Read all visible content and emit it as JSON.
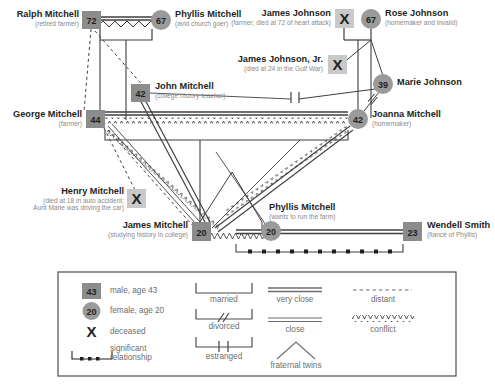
{
  "diagram": {
    "colors": {
      "male_fill": "#8c8c8c",
      "female_fill": "#9a9a9a",
      "line": "#3f3f3f",
      "label_name": "#231f20",
      "label_sub": "#8a8a8a",
      "legend_text": "#6d6d6d",
      "legend_border": "#4d4d4d"
    },
    "persons": [
      {
        "id": "ralph",
        "name": "Ralph Mitchell",
        "note": "(retired farmer)",
        "age": "72",
        "sex": "male",
        "deceased": false
      },
      {
        "id": "phyllis_sr",
        "name": "Phyllis Mitchell",
        "note": "(avid church goer)",
        "age": "67",
        "sex": "female",
        "deceased": false
      },
      {
        "id": "james_johnson",
        "name": "James Johnson",
        "note": "(farmer; died at 72 of heart attack)",
        "age": "",
        "sex": "male",
        "deceased": true,
        "marker": "X"
      },
      {
        "id": "rose",
        "name": "Rose Johnson",
        "note": "(homemaker and invalid)",
        "age": "67",
        "sex": "female",
        "deceased": false
      },
      {
        "id": "james_jr",
        "name": "James Johnson, Jr.",
        "note": "(died at 24 in the Gulf War)",
        "age": "",
        "sex": "male",
        "deceased": true,
        "marker": "X"
      },
      {
        "id": "john",
        "name": "John Mitchell",
        "note": "(college history teacher)",
        "age": "42",
        "sex": "male",
        "deceased": false
      },
      {
        "id": "marie",
        "name": "Marie Johnson",
        "note": "",
        "age": "39",
        "sex": "female",
        "deceased": false
      },
      {
        "id": "george",
        "name": "George Mitchell",
        "note": "(farmer)",
        "age": "44",
        "sex": "male",
        "deceased": false
      },
      {
        "id": "joanna",
        "name": "Joanna Mitchell",
        "note": "(homemaker)",
        "age": "42",
        "sex": "female",
        "deceased": false
      },
      {
        "id": "henry",
        "name": "Henry Mitchell",
        "note": "(died at 18 in auto accident; Aunt Marie was driving the car)",
        "age": "",
        "sex": "male",
        "deceased": true,
        "marker": "X"
      },
      {
        "id": "james_m",
        "name": "James Mitchell",
        "note": "(studying history in college)",
        "age": "20",
        "sex": "male",
        "deceased": false
      },
      {
        "id": "phyllis_jr",
        "name": "Phyllis Mitchell",
        "note": "(wants to run the farm)",
        "age": "20",
        "sex": "female",
        "deceased": false
      },
      {
        "id": "wendell",
        "name": "Wendell Smith",
        "note": "(fiancé of Phyllis)",
        "age": "23",
        "sex": "male",
        "deceased": false
      }
    ],
    "relationships": [
      {
        "from": "ralph",
        "to": "phyllis_sr",
        "type": "married"
      },
      {
        "from": "ralph",
        "to": "phyllis_sr",
        "type": "very close"
      },
      {
        "from": "ralph",
        "to": "phyllis_sr",
        "type": "conflict"
      },
      {
        "from": "james_johnson",
        "to": "rose",
        "type": "married"
      },
      {
        "from": "george",
        "to": "joanna",
        "type": "married"
      },
      {
        "from": "george",
        "to": "joanna",
        "type": "very close"
      },
      {
        "from": "george",
        "to": "joanna",
        "type": "conflict"
      },
      {
        "from": "marie",
        "to": "joanna",
        "type": "estranged"
      },
      {
        "from": "james_m",
        "to": "phyllis_jr",
        "type": "fraternal twins"
      },
      {
        "from": "james_m",
        "to": "phyllis_jr",
        "type": "conflict"
      },
      {
        "from": "phyllis_jr",
        "to": "wendell",
        "type": "very close"
      },
      {
        "from": "phyllis_jr",
        "to": "wendell",
        "type": "significant relationship"
      },
      {
        "from": "ralph",
        "to": "james_m",
        "type": "distant"
      },
      {
        "from": "ralph",
        "to": "john",
        "type": "distant"
      },
      {
        "from": "george",
        "to": "henry",
        "type": "distant"
      },
      {
        "from": "george",
        "to": "james_m",
        "type": "close"
      },
      {
        "from": "john",
        "to": "james_m",
        "type": "very close"
      },
      {
        "from": "joanna",
        "to": "james_m",
        "type": "conflict"
      },
      {
        "from": "george",
        "to": "phyllis_jr",
        "type": "conflict"
      }
    ]
  },
  "legend": {
    "items": [
      {
        "key": "male",
        "badge": "43",
        "label": "male, age 43"
      },
      {
        "key": "female",
        "badge": "20",
        "label": "female, age 20"
      },
      {
        "key": "deceased",
        "badge": "X",
        "label": "deceased"
      },
      {
        "key": "significant",
        "badge": "",
        "label": "significant relationship"
      }
    ],
    "marriage_lines": [
      {
        "key": "married",
        "label": "married"
      },
      {
        "key": "divorced",
        "label": "divorced"
      },
      {
        "key": "estranged",
        "label": "estranged"
      }
    ],
    "emotional_lines": [
      {
        "key": "very-close",
        "label": "very close"
      },
      {
        "key": "distant",
        "label": "distant"
      },
      {
        "key": "close",
        "label": "close"
      },
      {
        "key": "conflict",
        "label": "conflict"
      },
      {
        "key": "fraternal-twins",
        "label": "fraternal twins"
      }
    ]
  }
}
